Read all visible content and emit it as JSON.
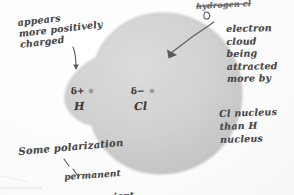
{
  "diagram": {
    "medium": "handwritten pencil on paper",
    "cloud": {
      "name": "electron-cloud",
      "fill_color": "#cfcfcf",
      "edge_color": "#b4b4b4",
      "description": "large circle distorted toward Cl with small bulge at H end"
    },
    "background_color": "#fdfdfd",
    "ink_color": "#4a4a4a"
  },
  "atoms": [
    {
      "element": "H",
      "partial_charge": "δ+",
      "nucleus": "nucleus-dot",
      "side": "left"
    },
    {
      "element": "Cl",
      "partial_charge": "δ−",
      "nucleus": "nucleus-dot",
      "side": "right"
    }
  ],
  "annotations": {
    "left": "appears\nmore positively\ncharged",
    "top_struck": "hydrogen cl",
    "right_upper": "electron\ncloud\nbeing\nattracted\nmore by",
    "right_lower": "Cl nucleus\nthan H\n    nucleus",
    "bottom": "Some polarization",
    "bottom_sub_line1": "permanent",
    "bottom_sub_not": "not",
    "bottom_sub_line2": " transient"
  },
  "arrows": [
    {
      "name": "arrow-to-h-end",
      "from": "charged label",
      "to": "δ+ H region"
    },
    {
      "name": "arrow-to-cloud",
      "from": "electron cloud label",
      "to": "cloud body"
    },
    {
      "name": "arrow-to-struck-label",
      "from": "hydrogen cl",
      "to": "curl mark"
    },
    {
      "name": "tick-to-permanent",
      "from": "polarization",
      "to": "permanent"
    }
  ]
}
